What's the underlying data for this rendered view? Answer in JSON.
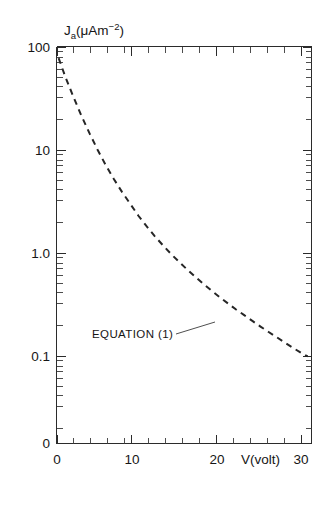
{
  "figure": {
    "background_color": "#ffffff",
    "line_color": "#262626",
    "axis_color": "#2b2b2b"
  },
  "labels": {
    "y_axis_title_main": "J",
    "y_axis_title_sub": "a",
    "y_axis_title_unit_open": "(μAm",
    "y_axis_title_unit_exp": "−2",
    "y_axis_title_unit_close": ")",
    "y_axis_title_full": "J a(μAm−2)",
    "x_axis_title": "V(volt)",
    "annotation": "EQUATION (1)"
  },
  "chart_data": {
    "type": "line",
    "title": "",
    "xlabel": "V(volt)",
    "ylabel": "J_a(μAm^-2)",
    "yscale": "log",
    "xscale": "linear",
    "xlim": [
      0,
      31.8
    ],
    "ylim": [
      0.04,
      100
    ],
    "grid": false,
    "legend": false,
    "x_ticks_major": [
      0,
      10,
      20,
      30
    ],
    "x_tick_labels": [
      "0",
      "10",
      "20",
      "30"
    ],
    "x_ticks_minor": [
      2,
      4,
      6,
      8,
      12,
      14,
      16,
      18,
      22,
      24,
      26,
      28
    ],
    "y_ticks_major": [
      100,
      10,
      1.0,
      0.1
    ],
    "y_tick_labels": [
      "100",
      "10",
      "1.0",
      "0.1"
    ],
    "y_origin_label": "0",
    "series": [
      {
        "name": "EQUATION (1)",
        "style": "dashed",
        "x": [
          0.2,
          1,
          2,
          3,
          4,
          5,
          6,
          7,
          8,
          9,
          10,
          11,
          12,
          13,
          14,
          15,
          16,
          17,
          18,
          19,
          20,
          21,
          22,
          23,
          24,
          25,
          26,
          27,
          28,
          29,
          30,
          30.8
        ],
        "y": [
          78,
          52,
          33,
          21.5,
          14.5,
          10.0,
          7.1,
          5.2,
          3.9,
          3.0,
          2.3,
          1.82,
          1.46,
          1.19,
          0.98,
          0.82,
          0.69,
          0.585,
          0.5,
          0.43,
          0.372,
          0.324,
          0.283,
          0.249,
          0.219,
          0.193,
          0.171,
          0.152,
          0.135,
          0.12,
          0.107,
          0.099
        ]
      }
    ],
    "annotations": [
      {
        "text": "EQUATION (1)",
        "x_value": 13.5,
        "y_value": 0.26,
        "leader_to_x": 19.0,
        "leader_to_y": 0.245
      }
    ]
  }
}
